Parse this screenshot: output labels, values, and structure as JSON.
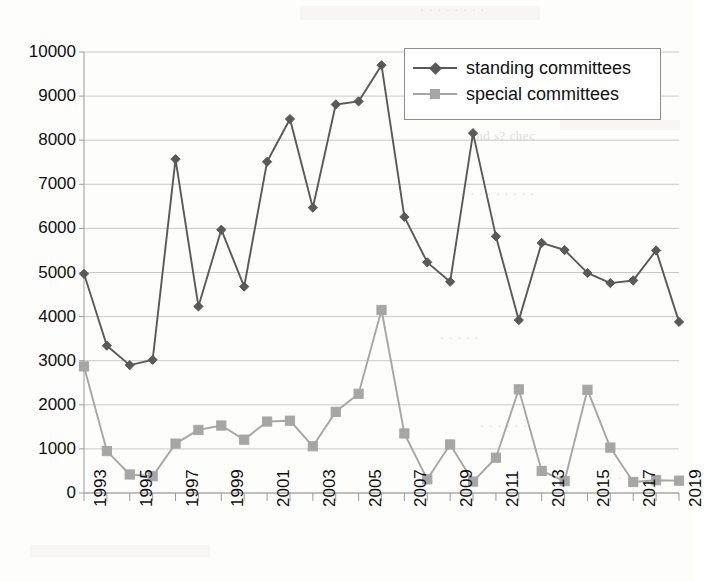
{
  "chart_data": {
    "type": "line",
    "title": "",
    "subtitle": "",
    "xlabel": "",
    "ylabel": "",
    "x": [
      1993,
      1994,
      1995,
      1996,
      1997,
      1998,
      1999,
      2000,
      2001,
      2002,
      2003,
      2004,
      2005,
      2006,
      2007,
      2008,
      2009,
      2010,
      2011,
      2012,
      2013,
      2014,
      2015,
      2016,
      2017,
      2018,
      2019
    ],
    "categories": [
      "1993",
      "1994",
      "1995",
      "1996",
      "1997",
      "1998",
      "1999",
      "2000",
      "2001",
      "2002",
      "2003",
      "2004",
      "2005",
      "2006",
      "2007",
      "2008",
      "2009",
      "2010",
      "2011",
      "2012",
      "2013",
      "2014",
      "2015",
      "2016",
      "2017",
      "2018",
      "2019"
    ],
    "x_tick_labels": [
      "1993",
      "1995",
      "1997",
      "1999",
      "2001",
      "2003",
      "2005",
      "2007",
      "2009",
      "2011",
      "2013",
      "2015",
      "2017",
      "2019"
    ],
    "y_tick_labels": [
      "0",
      "1000",
      "2000",
      "3000",
      "4000",
      "5000",
      "6000",
      "7000",
      "8000",
      "9000",
      "10000"
    ],
    "y_ticks": [
      0,
      1000,
      2000,
      3000,
      4000,
      5000,
      6000,
      7000,
      8000,
      9000,
      10000
    ],
    "xlim": [
      1993,
      2019
    ],
    "ylim": [
      0,
      10000
    ],
    "grid": "horizontal",
    "legend_position": "top-right",
    "series": [
      {
        "name": "standing committees",
        "color": "#595959",
        "marker": "diamond",
        "values": [
          4970,
          3340,
          2900,
          3020,
          7570,
          4230,
          5970,
          4680,
          7510,
          8480,
          6470,
          8810,
          8880,
          9700,
          6260,
          5230,
          4790,
          8160,
          5820,
          3920,
          5670,
          5510,
          4990,
          4760,
          4820,
          5500,
          3880
        ]
      },
      {
        "name": "special committees",
        "color": "#a6a6a6",
        "marker": "square",
        "values": [
          2870,
          950,
          420,
          380,
          1120,
          1430,
          1530,
          1210,
          1620,
          1640,
          1060,
          1840,
          2250,
          4150,
          1350,
          310,
          1100,
          260,
          800,
          2350,
          500,
          270,
          2340,
          1030,
          250,
          290,
          280
        ]
      }
    ]
  },
  "legend": {
    "items": [
      {
        "label": "standing committees",
        "marker": "diamond-marker",
        "color": "#595959"
      },
      {
        "label": "special committees",
        "marker": "square-marker",
        "color": "#a6a6a6"
      }
    ]
  },
  "style": {
    "grid_color": "#c9c9c9",
    "axis_color": "#9a9a9a",
    "text_color": "#0f0f0f",
    "background": "#ffffff"
  }
}
